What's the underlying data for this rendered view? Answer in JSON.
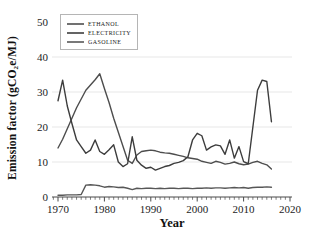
{
  "chart_data": {
    "type": "line",
    "title": "",
    "xlabel": "Year",
    "ylabel": "Emission factor (gCO₂e/MJ)",
    "xlim": [
      1968,
      2022
    ],
    "ylim": [
      0,
      50
    ],
    "x_ticks": [
      1970,
      1980,
      1990,
      2000,
      2010,
      2020
    ],
    "y_ticks": [
      0,
      10,
      20,
      30,
      40,
      50
    ],
    "gridlines": [
      10,
      20,
      30,
      40
    ],
    "grid": "on",
    "legend_position": "upper-left",
    "colors": {
      "grid": "#e4e4e4",
      "axis": "#4a4a4a",
      "background": "#ffffff"
    },
    "years": [
      1970,
      1971,
      1972,
      1973,
      1974,
      1975,
      1976,
      1977,
      1978,
      1979,
      1980,
      1981,
      1982,
      1983,
      1984,
      1985,
      1986,
      1987,
      1988,
      1989,
      1990,
      1991,
      1992,
      1993,
      1994,
      1995,
      1996,
      1997,
      1998,
      1999,
      2000,
      2001,
      2002,
      2003,
      2004,
      2005,
      2006,
      2007,
      2008,
      2009,
      2010,
      2011,
      2012,
      2013,
      2014,
      2015,
      2016
    ],
    "series": [
      {
        "name": "ETHANOL",
        "color": "#4d4d4d",
        "values": [
          14.0,
          16.5,
          19.5,
          22.5,
          25.5,
          28.0,
          30.5,
          32.0,
          33.5,
          35.2,
          31.0,
          27.0,
          22.5,
          18.5,
          14.5,
          10.5,
          9.6,
          12.0,
          13.0,
          13.2,
          13.4,
          13.2,
          12.8,
          12.6,
          12.5,
          12.2,
          11.9,
          11.6,
          11.2,
          11.0,
          10.8,
          10.2,
          9.9,
          9.6,
          10.2,
          9.9,
          9.4,
          9.6,
          10.0,
          9.5,
          9.2,
          9.4,
          9.9,
          10.2,
          9.6,
          9.2,
          8.0
        ]
      },
      {
        "name": "ELECTRICITY",
        "color": "#3d3d3d",
        "values": [
          27.5,
          33.4,
          26.0,
          21.0,
          16.3,
          14.4,
          12.5,
          13.4,
          16.3,
          13.0,
          12.2,
          13.5,
          14.9,
          10.0,
          8.7,
          9.5,
          17.2,
          10.5,
          9.1,
          8.2,
          8.5,
          7.7,
          8.2,
          8.7,
          9.0,
          9.6,
          9.9,
          10.4,
          11.5,
          16.3,
          18.2,
          17.5,
          13.4,
          14.3,
          14.9,
          14.6,
          12.2,
          16.3,
          11.1,
          14.4,
          10.1,
          9.5,
          20.0,
          30.5,
          33.4,
          33.0,
          21.5
        ]
      },
      {
        "name": "GASOLINE",
        "color": "#575757",
        "values": [
          0.5,
          0.5,
          0.6,
          0.6,
          0.6,
          0.7,
          3.4,
          3.5,
          3.4,
          3.2,
          2.8,
          3.0,
          2.9,
          2.7,
          2.8,
          2.5,
          2.1,
          2.5,
          2.4,
          2.5,
          2.5,
          2.4,
          2.5,
          2.4,
          2.5,
          2.5,
          2.4,
          2.5,
          2.5,
          2.4,
          2.5,
          2.5,
          2.6,
          2.5,
          2.6,
          2.6,
          2.5,
          2.6,
          2.7,
          2.6,
          2.7,
          2.5,
          2.7,
          2.8,
          2.8,
          2.9,
          2.8
        ]
      }
    ]
  }
}
